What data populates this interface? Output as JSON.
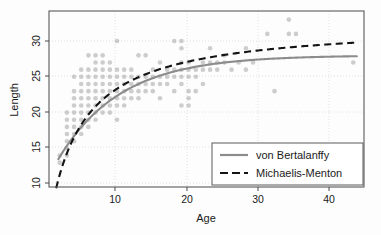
{
  "chart_data": {
    "type": "scatter",
    "title": "",
    "xlabel": "Age",
    "ylabel": "Length",
    "xlim": [
      0.5,
      44.5
    ],
    "ylim": [
      8.6,
      33.2
    ],
    "xticks": [
      10,
      20,
      30,
      40
    ],
    "yticks": [
      10,
      15,
      20,
      25,
      30
    ],
    "grid": true,
    "legend_position": "lower-right",
    "marker": {
      "shape": "circle",
      "color": "#8a8a8a",
      "opacity": 0.42,
      "size": 4.6
    },
    "points": [
      [
        2,
        13
      ],
      [
        2,
        12
      ],
      [
        3,
        14
      ],
      [
        3,
        13
      ],
      [
        3,
        15
      ],
      [
        3,
        16
      ],
      [
        3,
        17
      ],
      [
        3,
        18
      ],
      [
        3,
        19
      ],
      [
        4,
        15
      ],
      [
        4,
        16
      ],
      [
        4,
        17
      ],
      [
        4,
        18
      ],
      [
        4,
        19
      ],
      [
        4,
        20
      ],
      [
        4,
        21
      ],
      [
        4,
        22
      ],
      [
        4,
        24
      ],
      [
        5,
        16
      ],
      [
        5,
        17
      ],
      [
        5,
        18
      ],
      [
        5,
        19
      ],
      [
        5,
        20
      ],
      [
        5,
        21
      ],
      [
        5,
        22
      ],
      [
        5,
        23
      ],
      [
        5,
        24
      ],
      [
        5,
        25
      ],
      [
        6,
        17
      ],
      [
        6,
        18
      ],
      [
        6,
        19
      ],
      [
        6,
        20
      ],
      [
        6,
        21
      ],
      [
        6,
        22
      ],
      [
        6,
        23
      ],
      [
        6,
        24
      ],
      [
        6,
        25
      ],
      [
        6,
        27
      ],
      [
        7,
        18
      ],
      [
        7,
        19
      ],
      [
        7,
        20
      ],
      [
        7,
        21
      ],
      [
        7,
        22
      ],
      [
        7,
        23
      ],
      [
        7,
        24
      ],
      [
        7,
        25
      ],
      [
        7,
        26
      ],
      [
        7,
        27
      ],
      [
        8,
        19
      ],
      [
        8,
        20
      ],
      [
        8,
        21
      ],
      [
        8,
        22
      ],
      [
        8,
        23
      ],
      [
        8,
        24
      ],
      [
        8,
        25
      ],
      [
        8,
        26
      ],
      [
        8,
        27
      ],
      [
        9,
        19
      ],
      [
        9,
        20
      ],
      [
        9,
        21
      ],
      [
        9,
        22
      ],
      [
        9,
        23
      ],
      [
        9,
        24
      ],
      [
        9,
        25
      ],
      [
        9,
        26
      ],
      [
        10,
        18
      ],
      [
        10,
        20
      ],
      [
        10,
        21
      ],
      [
        10,
        22
      ],
      [
        10,
        23
      ],
      [
        10,
        24
      ],
      [
        10,
        25
      ],
      [
        10,
        29
      ],
      [
        11,
        20
      ],
      [
        11,
        21
      ],
      [
        11,
        22
      ],
      [
        11,
        23
      ],
      [
        11,
        24
      ],
      [
        11,
        25
      ],
      [
        12,
        21
      ],
      [
        12,
        22
      ],
      [
        12,
        23
      ],
      [
        12,
        24
      ],
      [
        12,
        25
      ],
      [
        13,
        21
      ],
      [
        13,
        22
      ],
      [
        13,
        23
      ],
      [
        13,
        24
      ],
      [
        13,
        27
      ],
      [
        14,
        22
      ],
      [
        14,
        23
      ],
      [
        14,
        24
      ],
      [
        14,
        27
      ],
      [
        15,
        22
      ],
      [
        15,
        23
      ],
      [
        15,
        24
      ],
      [
        15,
        25
      ],
      [
        16,
        21
      ],
      [
        16,
        23
      ],
      [
        16,
        24
      ],
      [
        16,
        26
      ],
      [
        17,
        23
      ],
      [
        17,
        24
      ],
      [
        17,
        25
      ],
      [
        18,
        22
      ],
      [
        18,
        24
      ],
      [
        18,
        25
      ],
      [
        18,
        29
      ],
      [
        19,
        20
      ],
      [
        19,
        23
      ],
      [
        19,
        24
      ],
      [
        19,
        25
      ],
      [
        19,
        26
      ],
      [
        19,
        28
      ],
      [
        19,
        29
      ],
      [
        20,
        20
      ],
      [
        20,
        21
      ],
      [
        20,
        22
      ],
      [
        20,
        24
      ],
      [
        20,
        25
      ],
      [
        20,
        26
      ],
      [
        21,
        22
      ],
      [
        21,
        24
      ],
      [
        21,
        25
      ],
      [
        22,
        23
      ],
      [
        22,
        25
      ],
      [
        22,
        26
      ],
      [
        23,
        25
      ],
      [
        23,
        26
      ],
      [
        23,
        28
      ],
      [
        24,
        25
      ],
      [
        24,
        26
      ],
      [
        25,
        26
      ],
      [
        25,
        27
      ],
      [
        26,
        25
      ],
      [
        27,
        26
      ],
      [
        28,
        25
      ],
      [
        28,
        28
      ],
      [
        29,
        26
      ],
      [
        31,
        30
      ],
      [
        32,
        22
      ],
      [
        34,
        30
      ],
      [
        34,
        32
      ],
      [
        35,
        30
      ],
      [
        43,
        26
      ]
    ],
    "series": [
      {
        "name": "von Bertalanffy",
        "style": "solid",
        "color": "#8c8c8c",
        "model": "Linf*(1-exp(-K*(t-t0)))",
        "params": {
          "Linf": 27.0,
          "K": 0.115,
          "t0": -3.6
        },
        "x_range": [
          1.8,
          43.5
        ]
      },
      {
        "name": "Michaelis-Menton",
        "style": "dashed",
        "color": "#141414",
        "model": "Lmax*t/(k+t)",
        "params": {
          "Lmax": 31.5,
          "k": 4.1
        },
        "x_range": [
          1.5,
          43.5
        ]
      }
    ],
    "legend": [
      {
        "label": "von Bertalanffy",
        "style": "solid",
        "color": "#8c8c8c"
      },
      {
        "label": "Michaelis-Menton",
        "style": "dashed",
        "color": "#141414"
      }
    ]
  },
  "axes": {
    "x_tick_labels": [
      "10",
      "20",
      "30",
      "40"
    ],
    "y_tick_labels": [
      "10",
      "15",
      "20",
      "25",
      "30"
    ],
    "x_title": "Age",
    "y_title": "Length"
  },
  "legend": {
    "item1_label": "von Bertalanffy",
    "item2_label": "Michaelis-Menton"
  }
}
